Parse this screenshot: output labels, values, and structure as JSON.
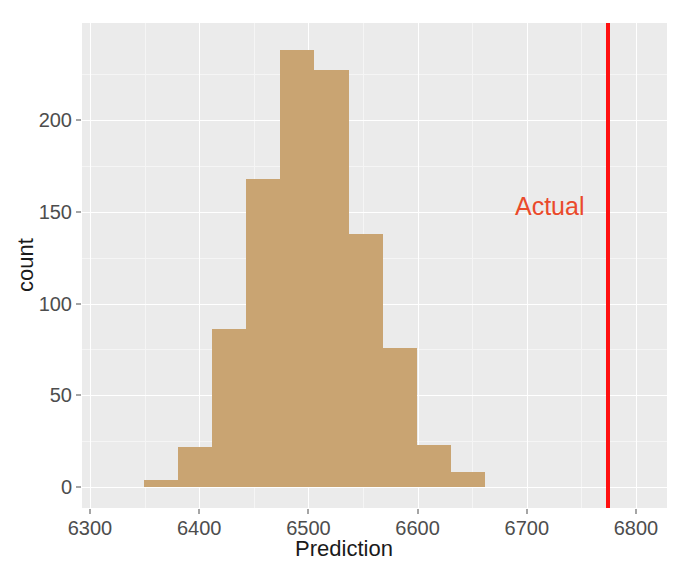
{
  "chart_data": {
    "type": "bar",
    "title": "",
    "subtitle": "",
    "xlabel": "Prediction",
    "ylabel": "count",
    "xlim": [
      6300,
      6800
    ],
    "ylim": [
      0,
      245
    ],
    "grid": true,
    "legend_position": "none",
    "bin_width": 31.3,
    "bin_edges": [
      6349,
      6380.3,
      6411.6,
      6442.9,
      6474.2,
      6505.5,
      6536.8,
      6568.1,
      6599.4,
      6630.7,
      6662
    ],
    "bin_centers": [
      6364.6,
      6395.9,
      6427.3,
      6458.6,
      6489.9,
      6521.2,
      6552.5,
      6583.8,
      6615.1,
      6646.4
    ],
    "values": [
      4,
      22,
      86,
      168,
      238,
      227,
      138,
      76,
      23,
      8
    ],
    "bar_color": "#C9A472",
    "panel_background": "#EBEBEB",
    "gridline_color": "#FFFFFF",
    "xticks": [
      6300,
      6400,
      6500,
      6600,
      6700,
      6800
    ],
    "xtick_labels": [
      "6300",
      "6400",
      "6500",
      "6600",
      "6700",
      "6800"
    ],
    "xticks_minor": [
      6350,
      6450,
      6550,
      6650,
      6750
    ],
    "yticks": [
      0,
      50,
      100,
      150,
      200
    ],
    "ytick_labels": [
      "0",
      "50",
      "100",
      "150",
      "200"
    ],
    "yticks_minor": [
      25,
      75,
      125,
      175,
      225
    ],
    "annotations": [
      {
        "name": "actual-line",
        "kind": "vline",
        "label": "Actual",
        "x": 6774,
        "color": "#FF1010",
        "label_color": "#EA4A2B",
        "label_x": 6721,
        "label_y": 152
      }
    ]
  }
}
